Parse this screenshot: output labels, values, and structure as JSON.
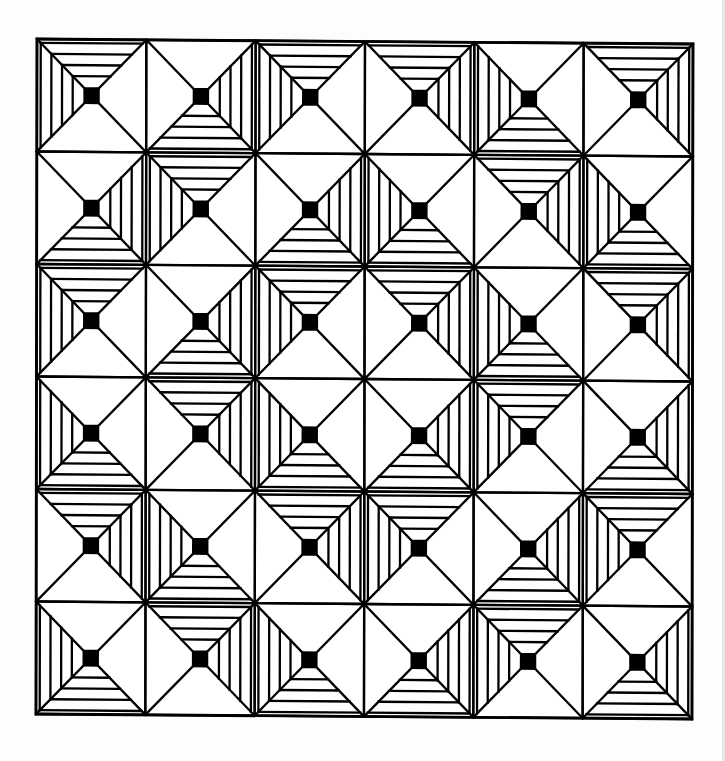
{
  "pattern": {
    "rows": 6,
    "cols": 6,
    "stroke_color": "#000000",
    "background_color": "#ffffff",
    "center_square_color": "#000000",
    "hatch_lines_per_triangle": 4,
    "hatch_key": {
      "TL": [
        "top",
        "left"
      ],
      "TR": [
        "top",
        "right"
      ],
      "RB": [
        "right",
        "bottom"
      ],
      "LB": [
        "left",
        "bottom"
      ]
    },
    "blocks": [
      [
        "TL",
        "RB",
        "TL",
        "TR",
        "LB",
        "TR"
      ],
      [
        "RB",
        "TL",
        "RB",
        "LB",
        "TR",
        "LB"
      ],
      [
        "TL",
        "RB",
        "TL",
        "TR",
        "LB",
        "TR"
      ],
      [
        "LB",
        "TR",
        "LB",
        "RB",
        "TL",
        "RB"
      ],
      [
        "TR",
        "LB",
        "TR",
        "TL",
        "RB",
        "TL"
      ],
      [
        "LB",
        "TR",
        "LB",
        "RB",
        "TL",
        "RB"
      ]
    ]
  }
}
